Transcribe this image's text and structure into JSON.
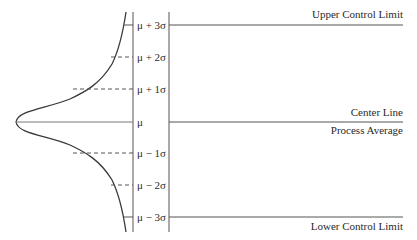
{
  "diagram": {
    "type": "control-chart-schematic",
    "labels": {
      "upper_control_limit": "Upper Control Limit",
      "center_line": "Center Line",
      "process_average": "Process Average",
      "lower_control_limit": "Lower Control Limit"
    },
    "sigma_levels": [
      {
        "label": "μ + 3σ"
      },
      {
        "label": "μ + 2σ"
      },
      {
        "label": "μ + 1σ"
      },
      {
        "label": "μ"
      },
      {
        "label": "μ − 1σ"
      },
      {
        "label": "μ − 2σ"
      },
      {
        "label": "μ − 3σ"
      }
    ],
    "colors": {
      "line": "#3a3a3a",
      "text": "#2a2a2a",
      "background": "#ffffff"
    }
  }
}
